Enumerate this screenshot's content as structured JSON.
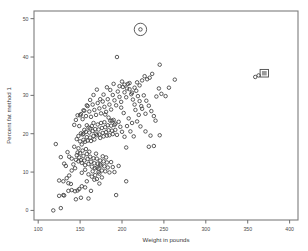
{
  "chart_data": {
    "type": "scatter",
    "title": "",
    "xlabel": "Weight in pounds",
    "ylabel": "Percent fat method 1",
    "xlim": [
      95,
      410
    ],
    "ylim": [
      -2.5,
      52
    ],
    "xticks": [
      100,
      150,
      200,
      250,
      300,
      350,
      400
    ],
    "yticks": [
      0,
      10,
      20,
      30,
      40,
      50
    ],
    "grid": false,
    "legend": null,
    "marker": "open-circle",
    "marker_color": "#3f3f3f",
    "frame_color": "#7d7d7d",
    "background": "#ffffff",
    "annotations": [
      {
        "kind": "circle-highlight",
        "x": 222,
        "y": 47.2,
        "label": ""
      },
      {
        "kind": "box-highlight",
        "x": 363,
        "y": 35.2,
        "label": ""
      }
    ],
    "n_points": 252,
    "points": [
      [
        118,
        0.0
      ],
      [
        127,
        0.6
      ],
      [
        125,
        3.8
      ],
      [
        130,
        4.0
      ],
      [
        131,
        3.9
      ],
      [
        136,
        5.1
      ],
      [
        140,
        5.3
      ],
      [
        145,
        2.9
      ],
      [
        151,
        3.3
      ],
      [
        160,
        3.1
      ],
      [
        193,
        4.0
      ],
      [
        125,
        7.8
      ],
      [
        130,
        7.6
      ],
      [
        136,
        7.1
      ],
      [
        139,
        6.9
      ],
      [
        144,
        5.0
      ],
      [
        147,
        5.2
      ],
      [
        149,
        5.6
      ],
      [
        152,
        6.3
      ],
      [
        156,
        6.0
      ],
      [
        158,
        7.6
      ],
      [
        163,
        5.1
      ],
      [
        167,
        8.0
      ],
      [
        170,
        8.2
      ],
      [
        173,
        7.0
      ],
      [
        205,
        7.6
      ],
      [
        121,
        17.3
      ],
      [
        127,
        13.9
      ],
      [
        131,
        12.2
      ],
      [
        133,
        11.6
      ],
      [
        135,
        15.2
      ],
      [
        137,
        14.0
      ],
      [
        140,
        13.5
      ],
      [
        142,
        12.0
      ],
      [
        143,
        16.6
      ],
      [
        145,
        13.2
      ],
      [
        146,
        14.4
      ],
      [
        147,
        15.1
      ],
      [
        148,
        12.8
      ],
      [
        149,
        13.8
      ],
      [
        150,
        14.9
      ],
      [
        151,
        13.1
      ],
      [
        152,
        12.4
      ],
      [
        153,
        15.6
      ],
      [
        154,
        14.2
      ],
      [
        155,
        13.0
      ],
      [
        156,
        11.8
      ],
      [
        157,
        16.0
      ],
      [
        158,
        14.7
      ],
      [
        159,
        13.4
      ],
      [
        160,
        12.1
      ],
      [
        161,
        15.3
      ],
      [
        162,
        14.0
      ],
      [
        163,
        12.7
      ],
      [
        164,
        11.4
      ],
      [
        165,
        10.2
      ],
      [
        166,
        13.6
      ],
      [
        167,
        12.3
      ],
      [
        168,
        11.0
      ],
      [
        169,
        14.8
      ],
      [
        170,
        13.5
      ],
      [
        171,
        12.2
      ],
      [
        172,
        10.9
      ],
      [
        173,
        9.6
      ],
      [
        174,
        13.0
      ],
      [
        175,
        11.7
      ],
      [
        176,
        10.4
      ],
      [
        177,
        14.1
      ],
      [
        178,
        12.8
      ],
      [
        179,
        11.5
      ],
      [
        180,
        10.2
      ],
      [
        181,
        13.8
      ],
      [
        182,
        12.5
      ],
      [
        183,
        11.2
      ],
      [
        185,
        9.9
      ],
      [
        187,
        12.6
      ],
      [
        189,
        11.3
      ],
      [
        191,
        10.0
      ],
      [
        196,
        11.6
      ],
      [
        146,
        18.6
      ],
      [
        148,
        19.4
      ],
      [
        150,
        18.0
      ],
      [
        151,
        20.1
      ],
      [
        152,
        17.2
      ],
      [
        153,
        19.8
      ],
      [
        154,
        18.4
      ],
      [
        155,
        21.0
      ],
      [
        156,
        17.9
      ],
      [
        157,
        20.5
      ],
      [
        158,
        19.1
      ],
      [
        159,
        18.2
      ],
      [
        160,
        21.6
      ],
      [
        161,
        20.3
      ],
      [
        162,
        19.0
      ],
      [
        163,
        18.1
      ],
      [
        164,
        22.0
      ],
      [
        165,
        20.7
      ],
      [
        166,
        19.4
      ],
      [
        167,
        18.5
      ],
      [
        168,
        21.2
      ],
      [
        169,
        20.0
      ],
      [
        170,
        19.6
      ],
      [
        171,
        22.4
      ],
      [
        172,
        21.1
      ],
      [
        173,
        19.8
      ],
      [
        174,
        18.9
      ],
      [
        175,
        22.8
      ],
      [
        176,
        21.5
      ],
      [
        177,
        20.2
      ],
      [
        178,
        19.3
      ],
      [
        179,
        23.0
      ],
      [
        180,
        21.7
      ],
      [
        181,
        20.4
      ],
      [
        182,
        19.5
      ],
      [
        183,
        22.2
      ],
      [
        184,
        20.9
      ],
      [
        185,
        19.6
      ],
      [
        186,
        23.4
      ],
      [
        187,
        22.1
      ],
      [
        188,
        20.8
      ],
      [
        189,
        19.9
      ],
      [
        190,
        23.6
      ],
      [
        191,
        22.3
      ],
      [
        192,
        21.0
      ],
      [
        194,
        19.7
      ],
      [
        196,
        23.1
      ],
      [
        198,
        21.8
      ],
      [
        200,
        20.5
      ],
      [
        203,
        19.2
      ],
      [
        206,
        22.0
      ],
      [
        210,
        20.6
      ],
      [
        214,
        19.3
      ],
      [
        218,
        23.2
      ],
      [
        222,
        21.9
      ],
      [
        228,
        20.6
      ],
      [
        234,
        19.5
      ],
      [
        238,
        16.8
      ],
      [
        232,
        16.6
      ],
      [
        205,
        16.4
      ],
      [
        143,
        22.3
      ],
      [
        145,
        23.6
      ],
      [
        147,
        24.8
      ],
      [
        149,
        22.0
      ],
      [
        151,
        25.1
      ],
      [
        153,
        23.8
      ],
      [
        155,
        26.0
      ],
      [
        157,
        24.6
      ],
      [
        159,
        27.2
      ],
      [
        161,
        25.8
      ],
      [
        163,
        24.4
      ],
      [
        165,
        27.6
      ],
      [
        167,
        26.2
      ],
      [
        169,
        24.9
      ],
      [
        171,
        28.0
      ],
      [
        173,
        26.6
      ],
      [
        175,
        25.3
      ],
      [
        177,
        28.4
      ],
      [
        179,
        27.0
      ],
      [
        181,
        25.7
      ],
      [
        183,
        29.0
      ],
      [
        185,
        27.6
      ],
      [
        187,
        26.3
      ],
      [
        189,
        30.1
      ],
      [
        191,
        28.7
      ],
      [
        193,
        27.4
      ],
      [
        195,
        31.0
      ],
      [
        197,
        29.6
      ],
      [
        199,
        28.3
      ],
      [
        201,
        32.2
      ],
      [
        203,
        30.8
      ],
      [
        205,
        29.5
      ],
      [
        207,
        33.0
      ],
      [
        209,
        31.6
      ],
      [
        211,
        30.3
      ],
      [
        213,
        28.9
      ],
      [
        215,
        27.6
      ],
      [
        217,
        31.2
      ],
      [
        219,
        29.8
      ],
      [
        221,
        28.5
      ],
      [
        223,
        27.2
      ],
      [
        226,
        30.0
      ],
      [
        229,
        28.6
      ],
      [
        232,
        27.3
      ],
      [
        235,
        25.9
      ],
      [
        238,
        24.6
      ],
      [
        241,
        29.7
      ],
      [
        244,
        31.8
      ],
      [
        247,
        30.4
      ],
      [
        263,
        34.1
      ],
      [
        245,
        38.0
      ],
      [
        236,
        35.6
      ],
      [
        233,
        34.6
      ],
      [
        230,
        34.2
      ],
      [
        227,
        35.0
      ],
      [
        224,
        33.9
      ],
      [
        221,
        32.6
      ],
      [
        218,
        33.4
      ],
      [
        215,
        32.0
      ],
      [
        212,
        30.7
      ],
      [
        209,
        33.2
      ],
      [
        206,
        31.8
      ],
      [
        203,
        32.8
      ],
      [
        200,
        33.6
      ],
      [
        197,
        32.4
      ],
      [
        194,
        40.0
      ],
      [
        190,
        33.0
      ],
      [
        186,
        31.4
      ],
      [
        182,
        32.1
      ],
      [
        178,
        30.2
      ],
      [
        174,
        29.0
      ],
      [
        170,
        31.5
      ],
      [
        166,
        30.1
      ],
      [
        162,
        28.8
      ],
      [
        158,
        27.4
      ],
      [
        154,
        26.1
      ],
      [
        150,
        24.8
      ],
      [
        180,
        25.0
      ],
      [
        184,
        24.2
      ],
      [
        188,
        23.4
      ],
      [
        192,
        22.6
      ],
      [
        199,
        26.8
      ],
      [
        202,
        25.4
      ],
      [
        208,
        24.0
      ],
      [
        212,
        22.8
      ],
      [
        216,
        26.2
      ],
      [
        220,
        24.9
      ],
      [
        224,
        26.5
      ],
      [
        228,
        25.2
      ],
      [
        148,
        16.2
      ],
      [
        152,
        9.8
      ],
      [
        156,
        10.6
      ],
      [
        160,
        9.4
      ],
      [
        164,
        8.8
      ],
      [
        168,
        9.2
      ],
      [
        172,
        10.0
      ],
      [
        176,
        8.6
      ],
      [
        144,
        11.0
      ],
      [
        140,
        10.4
      ],
      [
        137,
        9.1
      ],
      [
        134,
        8.4
      ],
      [
        170,
        11.2
      ],
      [
        174,
        12.0
      ],
      [
        154,
        20.0
      ],
      [
        158,
        22.2
      ],
      [
        162,
        21.4
      ],
      [
        166,
        22.8
      ],
      [
        245,
        19.6
      ],
      [
        240,
        23.4
      ],
      [
        252,
        29.8
      ],
      [
        256,
        32.0
      ],
      [
        222,
        47.2
      ],
      [
        363,
        35.2
      ],
      [
        359,
        34.8
      ]
    ]
  }
}
